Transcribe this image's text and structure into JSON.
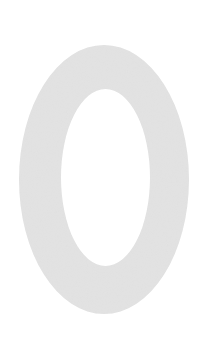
{
  "glyph": {
    "character": "0",
    "color": "#e3e3e3",
    "background": "#ffffff",
    "outer": {
      "cx": 104,
      "cy": 179.5,
      "rx": 85,
      "ry": 134.5
    },
    "inner": {
      "cx": 105.5,
      "cy": 177.5,
      "rx": 44.5,
      "ry": 88.5
    }
  }
}
